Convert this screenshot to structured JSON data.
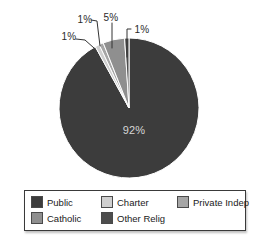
{
  "chart_data": {
    "type": "pie",
    "title": "",
    "unit": "%",
    "categories": [
      "Public",
      "Charter",
      "Private Indep",
      "Catholic",
      "Other Relig"
    ],
    "values": [
      92,
      1,
      1,
      5,
      1
    ],
    "series": [
      {
        "name": "Public",
        "value": 92,
        "label": "92%",
        "color": "#3c3c3c"
      },
      {
        "name": "Charter",
        "value": 1,
        "label": "1%",
        "color": "#cfcfcf"
      },
      {
        "name": "Private Indep",
        "value": 1,
        "label": "1%",
        "color": "#a6a6a6"
      },
      {
        "name": "Catholic",
        "value": 5,
        "label": "5%",
        "color": "#8f8f8f"
      },
      {
        "name": "Other Relig",
        "value": 1,
        "label": "1%",
        "color": "#4d4d4d"
      }
    ],
    "start_angle": "12-oclock, clockwise",
    "slice_separator_color": "#ffffff",
    "leader_line_color": "#333333",
    "legend_position": "bottom",
    "legend_rows": [
      [
        "Public",
        "Charter",
        "Private Indep"
      ],
      [
        "Catholic",
        "Other Relig"
      ]
    ]
  },
  "geometry": {
    "pie_center_x": 129,
    "pie_center_y": 108,
    "pie_radius": 70
  }
}
